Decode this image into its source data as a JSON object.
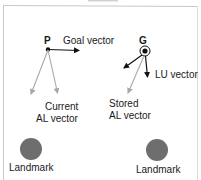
{
  "diagram": {
    "nodes": {
      "P": {
        "label": "P"
      },
      "G": {
        "label": "G"
      }
    },
    "vectors": {
      "goal": {
        "label": "Goal vector"
      },
      "lu": {
        "label": "LU vector"
      },
      "current_al": {
        "line1": "Current",
        "line2": "AL vector"
      },
      "stored_al": {
        "line1": "Stored",
        "line2": "AL vector"
      }
    },
    "landmarks": [
      {
        "label": "Landmark"
      },
      {
        "label": "Landmark"
      }
    ],
    "colors": {
      "frame": "#c8c8c8",
      "black_vector": "#111111",
      "gray_vector": "#a8a8a8",
      "landmark_fill": "#6e6e6e"
    }
  }
}
